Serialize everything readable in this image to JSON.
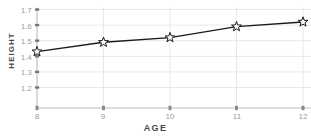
{
  "chart_data": {
    "type": "line",
    "title": "",
    "xlabel": "AGE",
    "ylabel": "HEIGHT",
    "x": [
      8,
      9,
      10,
      11,
      12
    ],
    "values": [
      1.43,
      1.49,
      1.52,
      1.59,
      1.62
    ],
    "series": [
      {
        "name": "height",
        "values": [
          1.43,
          1.49,
          1.52,
          1.59,
          1.62
        ]
      }
    ],
    "xticklabels": [
      "8",
      "9",
      "10",
      "11",
      "12"
    ],
    "yticklabels": [
      "1.2",
      "1.3",
      "1.4",
      "1.5",
      "1.6",
      "1.7"
    ],
    "yticks": [
      1.2,
      1.3,
      1.4,
      1.5,
      1.6,
      1.7
    ],
    "xlim": [
      8,
      12
    ],
    "ylim": [
      1.2,
      1.7
    ],
    "grid": true,
    "legend": "none",
    "marker": "star",
    "line_color": "#1a1a1a",
    "grid_color": "#e8e8e8",
    "tick_color": "#9a9a9a",
    "axis_color": "#bdbdbd"
  },
  "axes": {
    "y_axis_label": "HEIGHT",
    "x_axis_label": "AGE"
  }
}
